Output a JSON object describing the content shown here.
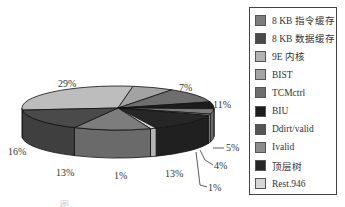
{
  "chart_data": {
    "type": "pie",
    "style": "3d-exploded-none",
    "title": "",
    "legend_position": "right",
    "categories": [
      "8 KB 指令缓存",
      "8 KB 数据缓存",
      "9E 内核",
      "BIST",
      "TCMctrl",
      "BIU",
      "Ddirt/valid",
      "Ivalid",
      "顶层树",
      "Rest.946"
    ],
    "slices": [
      {
        "label": "29%",
        "value": 29,
        "color": "#bdbdbd"
      },
      {
        "label": "7%",
        "value": 7,
        "color": "#a3a3a3"
      },
      {
        "label": "11%",
        "value": 11,
        "color": "#6e6e6e"
      },
      {
        "label": "5%",
        "value": 5,
        "color": "#1c1c1c"
      },
      {
        "label": "4%",
        "value": 4,
        "color": "#7a7a7a"
      },
      {
        "label": "1%",
        "value": 1,
        "color": "#b8b8b8"
      },
      {
        "label": "13%",
        "value": 13,
        "color": "#262626"
      },
      {
        "label": "1%",
        "value": 1,
        "color": "#d6d6d6"
      },
      {
        "label": "13%",
        "value": 13,
        "color": "#7d7d7d"
      },
      {
        "label": "16%",
        "value": 16,
        "color": "#4a4a4a"
      }
    ]
  },
  "legend": {
    "items": [
      {
        "label": "8 KB 指令缓存",
        "color": "#7d7d7d"
      },
      {
        "label": "8 KB 数据缓存",
        "color": "#4a4a4a"
      },
      {
        "label": "9E 内核",
        "color": "#b3b3b3"
      },
      {
        "label": "BIST",
        "color": "#a3a3a3"
      },
      {
        "label": "TCMctrl",
        "color": "#6e6e6e"
      },
      {
        "label": "BIU",
        "color": "#1c1c1c"
      },
      {
        "label": "Ddirt/valid",
        "color": "#555555"
      },
      {
        "label": "Ivalid",
        "color": "#8c8c8c"
      },
      {
        "label": "顶层树",
        "color": "#262626"
      },
      {
        "label": "Rest.946",
        "color": "#d6d6d6"
      }
    ]
  },
  "labels": {
    "p29": "29%",
    "p7": "7%",
    "p11": "11%",
    "p5": "5%",
    "p4": "4%",
    "p1a": "1%",
    "p13a": "13%",
    "p1b": "1%",
    "p13b": "13%",
    "p16": "16%"
  },
  "caption": "图"
}
